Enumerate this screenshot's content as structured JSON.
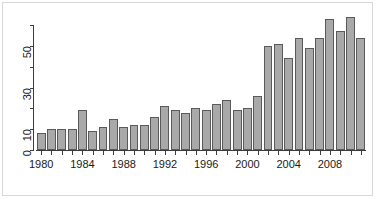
{
  "chart_data": {
    "type": "bar",
    "title": "",
    "subtitle": "",
    "xlabel": "",
    "ylabel": "",
    "xlim": [
      1979.5,
      2011.5
    ],
    "ylim": [
      0,
      60
    ],
    "grid": false,
    "legend": null,
    "bar_fill_color": "#a9a9a9",
    "bar_border_color": "#5a5a5a",
    "axis_color": "#3b3b3b",
    "background_color": "#ffffff",
    "y_axis": {
      "ticks": [
        0,
        10,
        20,
        30,
        40,
        50,
        60
      ],
      "labeled_ticks": [
        0,
        10,
        30,
        50
      ],
      "tick_labels": [
        "0",
        "10",
        "30",
        "50"
      ],
      "label_rotation_degrees": 90
    },
    "x_axis": {
      "labeled_ticks": [
        1980,
        1984,
        1988,
        1992,
        1996,
        2000,
        2004,
        2008
      ],
      "tick_labels": [
        "1980",
        "1984",
        "1988",
        "1992",
        "1996",
        "2000",
        "2004",
        "2008"
      ]
    },
    "categories": [
      "1980",
      "1981",
      "1982",
      "1983",
      "1984",
      "1985",
      "1986",
      "1987",
      "1988",
      "1989",
      "1990",
      "1991",
      "1992",
      "1993",
      "1994",
      "1995",
      "1996",
      "1997",
      "1998",
      "1999",
      "2000",
      "2001",
      "2002",
      "2003",
      "2004",
      "2005",
      "2006",
      "2007",
      "2008",
      "2009",
      "2010",
      "2011"
    ],
    "values": [
      8,
      10,
      10,
      10,
      19,
      9,
      11,
      15,
      11,
      12,
      12,
      16,
      21,
      19,
      18,
      20,
      19,
      22,
      24,
      19,
      20,
      26,
      50,
      51,
      44,
      54,
      49,
      54,
      63,
      57,
      64,
      54
    ]
  }
}
